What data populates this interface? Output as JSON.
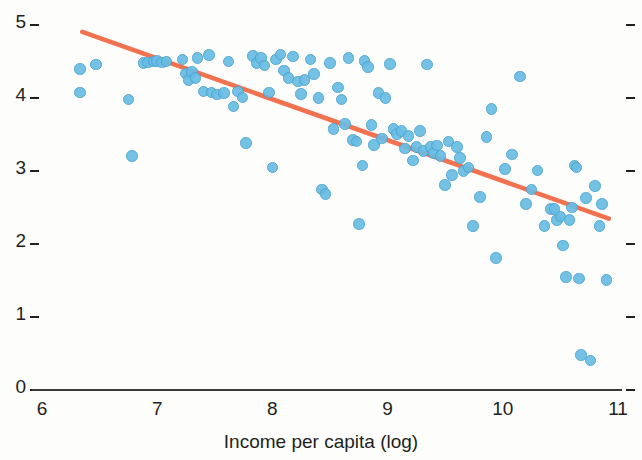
{
  "chart_data": {
    "type": "scatter",
    "title": "",
    "xlabel": "Income per capita (log)",
    "ylabel": "",
    "xlim": [
      5.7,
      11.05
    ],
    "ylim": [
      0,
      5.25
    ],
    "xticks": [
      6,
      7,
      8,
      9,
      10,
      11
    ],
    "xtick_labels": [
      "6",
      "7",
      "8",
      "9",
      "10",
      "11"
    ],
    "yticks": [
      0,
      1,
      2,
      3,
      4,
      5
    ],
    "ytick_labels": [
      "0",
      "1",
      "2",
      "3",
      "4",
      "5"
    ],
    "grid": false,
    "legend": null,
    "right_axis_ticks": [
      0,
      1,
      2,
      3,
      4,
      5
    ],
    "marker_color": "#69bde4",
    "marker_edge_color": "#4ba3cf",
    "trendline": {
      "color": "#f2714f",
      "x_start": 6.35,
      "y_start": 4.88,
      "x_end": 10.92,
      "y_end": 2.32,
      "slope": -0.561,
      "intercept": 8.44
    },
    "series": [
      {
        "name": "countries",
        "points": [
          [
            6.33,
            4.37
          ],
          [
            6.33,
            4.05
          ],
          [
            6.47,
            4.43
          ],
          [
            6.75,
            3.95
          ],
          [
            6.78,
            3.18
          ],
          [
            6.88,
            4.45
          ],
          [
            6.92,
            4.46
          ],
          [
            6.97,
            4.47
          ],
          [
            7.0,
            4.48
          ],
          [
            7.04,
            4.46
          ],
          [
            7.08,
            4.47
          ],
          [
            7.22,
            4.5
          ],
          [
            7.25,
            4.31
          ],
          [
            7.27,
            4.22
          ],
          [
            7.3,
            4.33
          ],
          [
            7.33,
            4.25
          ],
          [
            7.35,
            4.52
          ],
          [
            7.4,
            4.06
          ],
          [
            7.45,
            4.56
          ],
          [
            7.47,
            4.05
          ],
          [
            7.52,
            4.02
          ],
          [
            7.58,
            4.04
          ],
          [
            7.62,
            4.47
          ],
          [
            7.66,
            3.86
          ],
          [
            7.7,
            4.06
          ],
          [
            7.74,
            3.98
          ],
          [
            7.77,
            3.36
          ],
          [
            7.83,
            4.55
          ],
          [
            7.86,
            4.45
          ],
          [
            7.9,
            4.52
          ],
          [
            7.93,
            4.42
          ],
          [
            7.97,
            4.05
          ],
          [
            8.0,
            3.02
          ],
          [
            8.03,
            4.5
          ],
          [
            8.07,
            4.57
          ],
          [
            8.1,
            4.35
          ],
          [
            8.14,
            4.25
          ],
          [
            8.18,
            4.54
          ],
          [
            8.22,
            4.2
          ],
          [
            8.25,
            4.03
          ],
          [
            8.28,
            4.22
          ],
          [
            8.33,
            4.5
          ],
          [
            8.36,
            4.3
          ],
          [
            8.4,
            3.97
          ],
          [
            8.43,
            2.72
          ],
          [
            8.46,
            2.66
          ],
          [
            8.5,
            4.45
          ],
          [
            8.53,
            3.55
          ],
          [
            8.57,
            4.12
          ],
          [
            8.6,
            3.95
          ],
          [
            8.63,
            3.62
          ],
          [
            8.66,
            4.52
          ],
          [
            8.7,
            3.4
          ],
          [
            8.73,
            3.38
          ],
          [
            8.75,
            2.25
          ],
          [
            8.78,
            3.05
          ],
          [
            8.8,
            4.48
          ],
          [
            8.83,
            4.4
          ],
          [
            8.86,
            3.6
          ],
          [
            8.88,
            3.33
          ],
          [
            8.92,
            4.04
          ],
          [
            8.95,
            3.42
          ],
          [
            8.98,
            3.97
          ],
          [
            9.02,
            4.44
          ],
          [
            9.05,
            3.55
          ],
          [
            9.08,
            3.48
          ],
          [
            9.12,
            3.52
          ],
          [
            9.15,
            3.28
          ],
          [
            9.18,
            3.45
          ],
          [
            9.22,
            3.12
          ],
          [
            9.25,
            3.3
          ],
          [
            9.28,
            3.52
          ],
          [
            9.31,
            3.25
          ],
          [
            9.34,
            4.43
          ],
          [
            9.37,
            3.3
          ],
          [
            9.4,
            3.22
          ],
          [
            9.43,
            3.32
          ],
          [
            9.46,
            3.18
          ],
          [
            9.5,
            2.78
          ],
          [
            9.53,
            3.38
          ],
          [
            9.56,
            2.92
          ],
          [
            9.6,
            3.3
          ],
          [
            9.63,
            3.15
          ],
          [
            9.66,
            2.97
          ],
          [
            9.7,
            3.02
          ],
          [
            9.74,
            2.22
          ],
          [
            9.8,
            2.62
          ],
          [
            9.86,
            3.44
          ],
          [
            9.9,
            3.82
          ],
          [
            9.94,
            1.78
          ],
          [
            10.02,
            3.0
          ],
          [
            10.08,
            3.2
          ],
          [
            10.15,
            4.27
          ],
          [
            10.2,
            2.52
          ],
          [
            10.25,
            2.72
          ],
          [
            10.3,
            2.98
          ],
          [
            10.36,
            2.22
          ],
          [
            10.42,
            2.45
          ],
          [
            10.45,
            2.45
          ],
          [
            10.47,
            2.3
          ],
          [
            10.5,
            2.35
          ],
          [
            10.52,
            1.95
          ],
          [
            10.55,
            1.52
          ],
          [
            10.58,
            2.3
          ],
          [
            10.6,
            2.47
          ],
          [
            10.62,
            3.05
          ],
          [
            10.64,
            3.02
          ],
          [
            10.66,
            1.5
          ],
          [
            10.68,
            0.45
          ],
          [
            10.72,
            2.6
          ],
          [
            10.76,
            0.38
          ],
          [
            10.8,
            2.77
          ],
          [
            10.84,
            2.22
          ],
          [
            10.86,
            2.52
          ],
          [
            10.9,
            1.48
          ]
        ]
      }
    ]
  },
  "axes": {
    "x_title": "Income per capita (log)"
  }
}
